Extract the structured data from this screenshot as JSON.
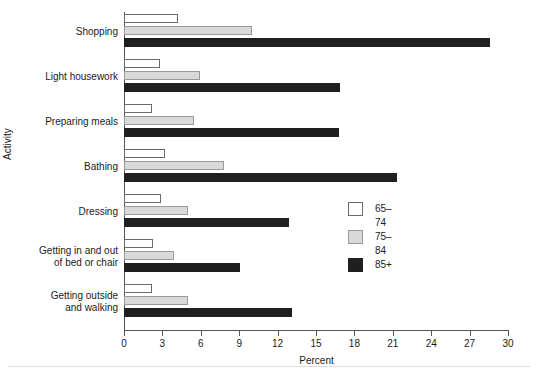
{
  "chart_data": {
    "type": "bar",
    "orientation": "horizontal",
    "title": "",
    "xlabel": "Percent",
    "ylabel": "Activity",
    "xlim": [
      0,
      30
    ],
    "xticks": [
      0,
      3,
      6,
      9,
      12,
      15,
      18,
      21,
      24,
      27,
      30
    ],
    "grid": false,
    "legend_position": "center-right",
    "categories": [
      "Shopping",
      "Light housework",
      "Preparing meals",
      "Bathing",
      "Dressing",
      "Getting in and out\nof bed or chair",
      "Getting outside\nand walking"
    ],
    "series": [
      {
        "name": "65–74",
        "color": "#ffffff",
        "values": [
          4.2,
          2.8,
          2.2,
          3.2,
          2.9,
          2.3,
          2.2
        ]
      },
      {
        "name": "75–84",
        "color": "#d9d9d9",
        "values": [
          10.0,
          5.9,
          5.5,
          7.8,
          5.0,
          3.9,
          5.0
        ]
      },
      {
        "name": "85+",
        "color": "#1f1f1f",
        "values": [
          28.6,
          16.9,
          16.8,
          21.3,
          12.9,
          9.1,
          13.1
        ]
      }
    ]
  }
}
